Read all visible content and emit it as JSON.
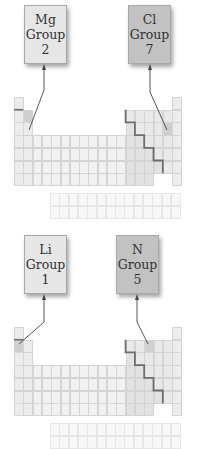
{
  "panels": [
    {
      "name": "top",
      "labels": [
        {
          "symbol": "Mg",
          "group_word": "Group",
          "group_num": "2",
          "shade": "light"
        },
        {
          "symbol": "Cl",
          "group_word": "Group",
          "group_num": "7",
          "shade": "dark"
        }
      ],
      "highlight_cells": [
        [
          2,
          2
        ],
        [
          3,
          17
        ]
      ]
    },
    {
      "name": "bottom",
      "labels": [
        {
          "symbol": "Li",
          "group_word": "Group",
          "group_num": "1",
          "shade": "light"
        },
        {
          "symbol": "N",
          "group_word": "Group",
          "group_num": "5",
          "shade": "dark"
        }
      ],
      "highlight_cells": [
        [
          2,
          1
        ],
        [
          2,
          15
        ]
      ]
    }
  ],
  "colors": {
    "s_block": "#ececec",
    "d_block": "#f1f1f1",
    "p_block_metal": "#e2e2e2",
    "p_block_nonmetal": "#e9e9e9",
    "noble": "#ececec",
    "highlight": "#cfcfcf",
    "staircase": "#6e6e6e",
    "arrow": "#444444"
  }
}
